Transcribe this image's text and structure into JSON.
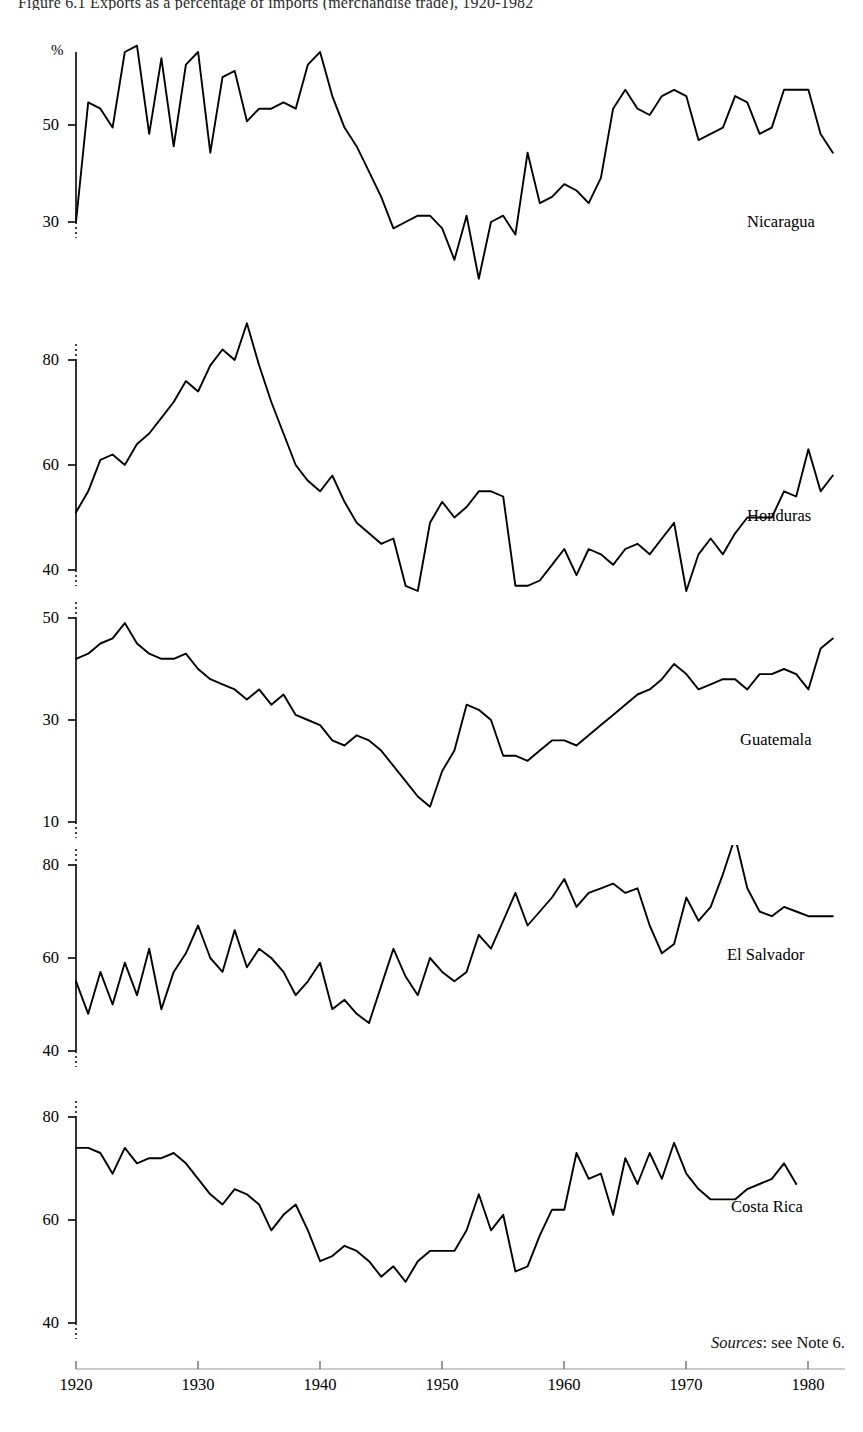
{
  "figure": {
    "title": "Figure 6.1 Exports as a percentage of imports (merchandise trade), 1920-1982",
    "sources_prefix": "Sources",
    "sources_text": ": see Note 6.",
    "y_unit": "%"
  },
  "x_axis": {
    "ticks": [
      1920,
      1930,
      1940,
      1950,
      1960,
      1970,
      1980
    ],
    "tick_labels": [
      "1920",
      "1930",
      "1940",
      "1950",
      "1960",
      "1970",
      "1980"
    ],
    "range": [
      1920,
      1983
    ]
  },
  "panels": [
    {
      "label": "Nicaragua",
      "y_ticks": [
        30,
        50
      ],
      "y_tick_labels": [
        "30",
        "50"
      ],
      "ylim": [
        18,
        62
      ]
    },
    {
      "label": "Honduras",
      "y_ticks": [
        40,
        60,
        80
      ],
      "y_tick_labels": [
        "40",
        "60",
        "80"
      ],
      "ylim": [
        31,
        90
      ]
    },
    {
      "label": "Guatemala",
      "y_ticks": [
        10,
        30,
        50
      ],
      "y_tick_labels": [
        "10",
        "30",
        "50"
      ],
      "ylim": [
        8,
        52
      ]
    },
    {
      "label": "El Salvador",
      "y_ticks": [
        40,
        60,
        80
      ],
      "y_tick_labels": [
        "40",
        "60",
        "80"
      ],
      "ylim": [
        38,
        88
      ]
    },
    {
      "label": "Costa Rica",
      "y_ticks": [
        40,
        60,
        80
      ],
      "y_tick_labels": [
        "40",
        "60",
        "80"
      ],
      "ylim": [
        38,
        82
      ]
    }
  ],
  "chart_data": [
    {
      "type": "line",
      "title": "Nicaragua",
      "xlabel": "",
      "ylabel": "%",
      "xlim": [
        1920,
        1983
      ],
      "ylim": [
        18,
        62
      ],
      "grid": false,
      "legend": "inline-right",
      "x": [
        1920,
        1921,
        1922,
        1923,
        1924,
        1925,
        1926,
        1927,
        1928,
        1929,
        1930,
        1931,
        1932,
        1933,
        1934,
        1935,
        1936,
        1937,
        1938,
        1939,
        1940,
        1941,
        1942,
        1943,
        1944,
        1945,
        1946,
        1947,
        1948,
        1949,
        1950,
        1951,
        1952,
        1953,
        1954,
        1955,
        1956,
        1957,
        1958,
        1959,
        1960,
        1961,
        1962,
        1963,
        1964,
        1965,
        1966,
        1967,
        1968,
        1969,
        1970,
        1971,
        1972,
        1973,
        1974,
        1975,
        1976,
        1977,
        1978,
        1979,
        1980,
        1981,
        1982
      ],
      "values": [
        30,
        49,
        48,
        45,
        57,
        58,
        44,
        56,
        42,
        55,
        57,
        41,
        53,
        54,
        46,
        48,
        48,
        49,
        48,
        55,
        57,
        50,
        45,
        42,
        38,
        34,
        29,
        30,
        31,
        31,
        29,
        24,
        31,
        21,
        30,
        31,
        28,
        41,
        33,
        34,
        36,
        35,
        33,
        37,
        48,
        51,
        48,
        47,
        50,
        51,
        50,
        43,
        44,
        45,
        50,
        49,
        44,
        45,
        51,
        51,
        51,
        44,
        41,
        43
      ]
    },
    {
      "type": "line",
      "title": "Honduras",
      "xlabel": "",
      "ylabel": "%",
      "xlim": [
        1920,
        1983
      ],
      "ylim": [
        31,
        90
      ],
      "grid": false,
      "legend": "inline-right",
      "x": [
        1920,
        1921,
        1922,
        1923,
        1924,
        1925,
        1926,
        1927,
        1928,
        1929,
        1930,
        1931,
        1932,
        1933,
        1934,
        1935,
        1936,
        1937,
        1938,
        1939,
        1940,
        1941,
        1942,
        1943,
        1944,
        1945,
        1946,
        1947,
        1948,
        1949,
        1950,
        1951,
        1952,
        1953,
        1954,
        1955,
        1956,
        1957,
        1958,
        1959,
        1960,
        1961,
        1962,
        1963,
        1964,
        1965,
        1966,
        1967,
        1968,
        1969,
        1970,
        1971,
        1972,
        1973,
        1974,
        1975,
        1976,
        1977,
        1978,
        1979,
        1980,
        1981,
        1982
      ],
      "values": [
        51,
        55,
        61,
        62,
        60,
        64,
        66,
        69,
        72,
        76,
        74,
        79,
        82,
        80,
        87,
        79,
        72,
        66,
        60,
        57,
        55,
        58,
        53,
        49,
        47,
        45,
        46,
        37,
        36,
        49,
        53,
        50,
        52,
        55,
        55,
        54,
        37,
        37,
        38,
        41,
        44,
        39,
        44,
        43,
        41,
        44,
        45,
        43,
        46,
        49,
        36,
        43,
        46,
        43,
        47,
        50,
        50,
        50,
        55,
        54,
        63,
        55,
        58,
        58
      ]
    },
    {
      "type": "line",
      "title": "Guatemala",
      "xlabel": "",
      "ylabel": "%",
      "xlim": [
        1920,
        1983
      ],
      "ylim": [
        8,
        52
      ],
      "grid": false,
      "legend": "inline-right",
      "x": [
        1920,
        1921,
        1922,
        1923,
        1924,
        1925,
        1926,
        1927,
        1928,
        1929,
        1930,
        1931,
        1932,
        1933,
        1934,
        1935,
        1936,
        1937,
        1938,
        1939,
        1940,
        1941,
        1942,
        1943,
        1944,
        1945,
        1946,
        1947,
        1948,
        1949,
        1950,
        1951,
        1952,
        1953,
        1954,
        1955,
        1956,
        1957,
        1958,
        1959,
        1960,
        1961,
        1962,
        1963,
        1964,
        1965,
        1966,
        1967,
        1968,
        1969,
        1970,
        1971,
        1972,
        1973,
        1974,
        1975,
        1976,
        1977,
        1978,
        1979,
        1980,
        1981,
        1982
      ],
      "values": [
        42,
        43,
        45,
        46,
        49,
        45,
        43,
        42,
        42,
        43,
        40,
        38,
        37,
        36,
        34,
        36,
        33,
        35,
        31,
        30,
        29,
        26,
        25,
        27,
        26,
        24,
        21,
        18,
        15,
        13,
        20,
        24,
        33,
        32,
        30,
        23,
        23,
        22,
        24,
        26,
        26,
        25,
        27,
        29,
        31,
        33,
        35,
        36,
        38,
        41,
        39,
        36,
        37,
        38,
        38,
        36,
        39,
        39,
        40,
        39,
        36,
        44,
        46,
        28
      ]
    },
    {
      "type": "line",
      "title": "El Salvador",
      "xlabel": "",
      "ylabel": "%",
      "xlim": [
        1920,
        1983
      ],
      "ylim": [
        38,
        88
      ],
      "grid": false,
      "legend": "inline-right",
      "x": [
        1920,
        1921,
        1922,
        1923,
        1924,
        1925,
        1926,
        1927,
        1928,
        1929,
        1930,
        1931,
        1932,
        1933,
        1934,
        1935,
        1936,
        1937,
        1938,
        1939,
        1940,
        1941,
        1942,
        1943,
        1944,
        1945,
        1946,
        1947,
        1948,
        1949,
        1950,
        1951,
        1952,
        1953,
        1954,
        1955,
        1956,
        1957,
        1958,
        1959,
        1960,
        1961,
        1962,
        1963,
        1964,
        1965,
        1966,
        1967,
        1968,
        1969,
        1970,
        1971,
        1972,
        1973,
        1974,
        1975,
        1976,
        1977,
        1978,
        1979,
        1980,
        1981,
        1982
      ],
      "values": [
        55,
        48,
        57,
        50,
        59,
        52,
        62,
        49,
        57,
        61,
        67,
        60,
        57,
        66,
        58,
        62,
        60,
        57,
        52,
        55,
        59,
        49,
        51,
        48,
        46,
        54,
        62,
        56,
        52,
        60,
        57,
        55,
        57,
        65,
        62,
        68,
        74,
        67,
        70,
        73,
        77,
        71,
        74,
        75,
        76,
        74,
        75,
        67,
        61,
        63,
        73,
        68,
        71,
        78,
        86,
        75,
        70,
        69,
        71,
        70,
        69,
        69,
        69
      ]
    },
    {
      "type": "line",
      "title": "Costa Rica",
      "xlabel": "",
      "ylabel": "%",
      "xlim": [
        1920,
        1983
      ],
      "ylim": [
        38,
        82
      ],
      "grid": false,
      "legend": "inline-right",
      "x": [
        1920,
        1921,
        1922,
        1923,
        1924,
        1925,
        1926,
        1927,
        1928,
        1929,
        1930,
        1931,
        1932,
        1933,
        1934,
        1935,
        1936,
        1937,
        1938,
        1939,
        1940,
        1941,
        1942,
        1943,
        1944,
        1945,
        1946,
        1947,
        1948,
        1949,
        1950,
        1951,
        1952,
        1953,
        1954,
        1955,
        1956,
        1957,
        1958,
        1959,
        1960,
        1961,
        1962,
        1963,
        1964,
        1965,
        1966,
        1967,
        1968,
        1969,
        1970,
        1971,
        1972,
        1973,
        1974,
        1975,
        1976,
        1977,
        1978,
        1979,
        1980,
        1981,
        1982
      ],
      "values": [
        74,
        74,
        73,
        69,
        74,
        71,
        72,
        72,
        73,
        71,
        68,
        65,
        63,
        66,
        65,
        63,
        58,
        61,
        63,
        58,
        52,
        53,
        55,
        54,
        52,
        49,
        51,
        48,
        52,
        54,
        54,
        54,
        58,
        65,
        58,
        61,
        50,
        51,
        57,
        62,
        62,
        73,
        68,
        69,
        61,
        72,
        67,
        73,
        68,
        75,
        69,
        66,
        64,
        64,
        64,
        66,
        67,
        68,
        71,
        67
      ]
    }
  ]
}
